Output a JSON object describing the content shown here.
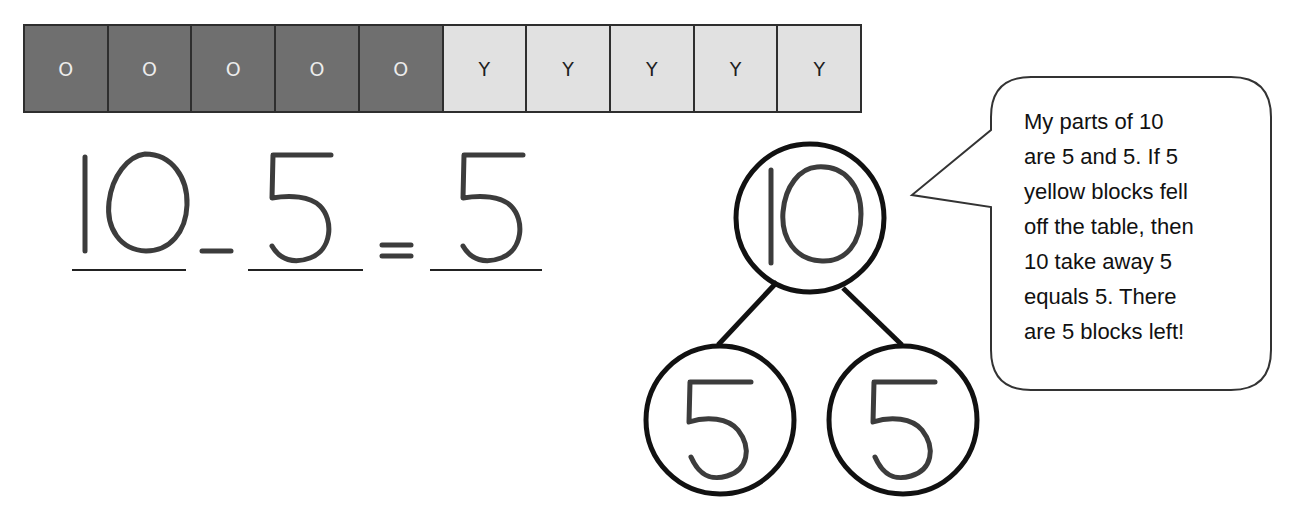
{
  "block_strip": {
    "cells": [
      {
        "label": "O",
        "color": "orange",
        "fill": "#6f6f6f"
      },
      {
        "label": "O",
        "color": "orange",
        "fill": "#6f6f6f"
      },
      {
        "label": "O",
        "color": "orange",
        "fill": "#6f6f6f"
      },
      {
        "label": "O",
        "color": "orange",
        "fill": "#6f6f6f"
      },
      {
        "label": "O",
        "color": "orange",
        "fill": "#6f6f6f"
      },
      {
        "label": "Y",
        "color": "yellow",
        "fill": "#e1e1e1"
      },
      {
        "label": "Y",
        "color": "yellow",
        "fill": "#e1e1e1"
      },
      {
        "label": "Y",
        "color": "yellow",
        "fill": "#e1e1e1"
      },
      {
        "label": "Y",
        "color": "yellow",
        "fill": "#e1e1e1"
      },
      {
        "label": "Y",
        "color": "yellow",
        "fill": "#e1e1e1"
      }
    ]
  },
  "equation": {
    "minuend": "10",
    "operator": "-",
    "subtrahend": "5",
    "equals": "=",
    "difference": "5",
    "text": "10 - 5 = 5"
  },
  "number_bond": {
    "whole": "10",
    "part_left": "5",
    "part_right": "5"
  },
  "speech_bubble": {
    "lines": [
      "My parts of 10",
      "are 5 and 5.  If 5",
      "yellow blocks fell",
      "off the table, then",
      "10 take away 5",
      "equals 5.  There",
      "are 5 blocks left!"
    ]
  },
  "colors": {
    "dark_block": "#6f6f6f",
    "light_block": "#e1e1e1",
    "ink": "#3c3c3c",
    "outline": "#111111"
  }
}
